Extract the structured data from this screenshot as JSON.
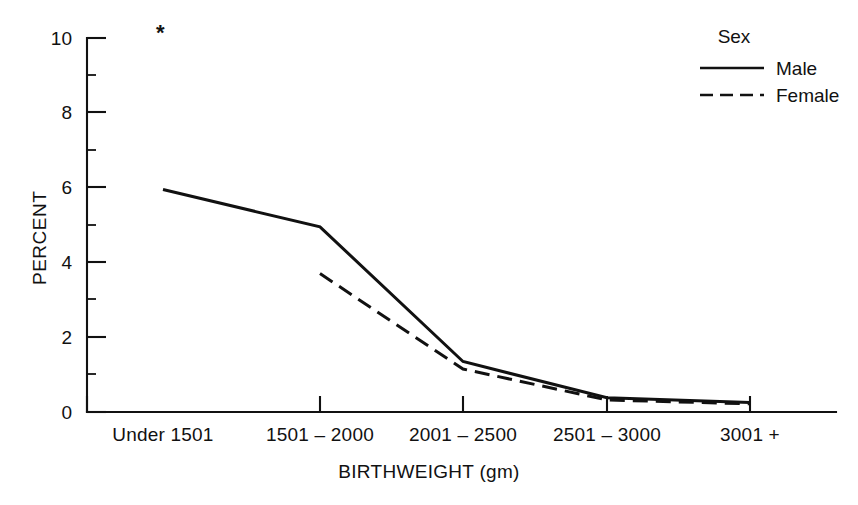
{
  "chart_data": {
    "type": "line",
    "title": "",
    "xlabel": "BIRTHWEIGHT (gm)",
    "ylabel": "PERCENT",
    "categories": [
      "Under 1501",
      "1501 – 2000",
      "2001 – 2500",
      "2501 – 3000",
      "3001 +"
    ],
    "series": [
      {
        "name": "Male",
        "style": "solid",
        "values": [
          5.95,
          4.95,
          1.35,
          0.38,
          0.25
        ]
      },
      {
        "name": "Female",
        "style": "dashed",
        "values": [
          null,
          3.7,
          1.15,
          0.32,
          0.22
        ]
      }
    ],
    "ylim": [
      0,
      10
    ],
    "yticks": [
      0,
      2,
      4,
      6,
      8,
      10
    ],
    "yticks_minor": [
      1,
      3,
      5,
      7,
      9
    ],
    "ytick_labels": [
      "0",
      "2",
      "4",
      "6",
      "8",
      "10"
    ],
    "grid": false,
    "legend_position": "top-right",
    "legend_title": "Sex",
    "annotations": [
      {
        "name": "footnote-asterisk",
        "text": "*",
        "category": "Under 1501",
        "note": "asterisk marking suppressed/unstable value for female under 1501"
      }
    ]
  },
  "legend": {
    "title": "Sex",
    "entries": [
      {
        "label": "Male",
        "style": "solid"
      },
      {
        "label": "Female",
        "style": "dashed"
      }
    ]
  },
  "axes": {
    "y_title": "PERCENT",
    "x_title": "BIRTHWEIGHT (gm)"
  }
}
